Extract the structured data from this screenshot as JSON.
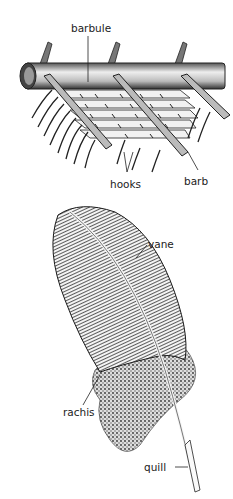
{
  "diagram": {
    "top_panel": {
      "name": "barb detail",
      "labels": {
        "barbule": "barbule",
        "hooks": "hooks",
        "barb": "barb"
      }
    },
    "bottom_panel": {
      "name": "whole feather",
      "labels": {
        "vane": "vane",
        "rachis": "rachis",
        "quill": "quill"
      }
    },
    "colors": {
      "ink": "#1a1a1a",
      "background": "#ffffff",
      "shade": "#6b6b6b"
    }
  }
}
